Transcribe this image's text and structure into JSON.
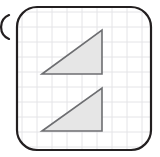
{
  "figure": {
    "title": "Two congruent right triangles on a square grid",
    "answer_choice_marker": "partial-circle-arc-clipped-left-edge",
    "background_color": "#ffffff",
    "card": {
      "name": "rounded-rectangle-panel",
      "x": 17,
      "y": 7,
      "width": 134,
      "height": 143,
      "corner_radius": 20,
      "stroke_color": "#231f20",
      "stroke_width": 2.2,
      "fill_color": "#ffffff"
    },
    "clipped_marker": {
      "name": "clipped-arc",
      "center_x": -4,
      "center_y": 27,
      "radius": 13,
      "stroke_color": "#231f20",
      "stroke_width": 2.2
    },
    "grid": {
      "name": "square-grid",
      "line_color": "#e4e4e7",
      "line_width": 1,
      "cell_size": 15,
      "origin_x": 22,
      "origin_y": 12,
      "columns": 8,
      "rows": 9,
      "visible": true
    },
    "shapes": [
      {
        "name": "triangle-upper",
        "type": "right-triangle",
        "right_angle_vertex": "bottom-right",
        "orientation": "hypotenuse-rises-left-to-right",
        "fill_color": "#e6e6e6",
        "stroke_color": "#6d6e71",
        "stroke_width": 1.6,
        "points": [
          {
            "x": 42,
            "y": 74
          },
          {
            "x": 102,
            "y": 30
          },
          {
            "x": 102,
            "y": 74
          }
        ],
        "base_length_px": 60,
        "height_px": 44
      },
      {
        "name": "triangle-lower",
        "type": "right-triangle",
        "right_angle_vertex": "bottom-right",
        "orientation": "hypotenuse-rises-left-to-right",
        "fill_color": "#e6e6e6",
        "stroke_color": "#6d6e71",
        "stroke_width": 1.6,
        "points": [
          {
            "x": 42,
            "y": 131
          },
          {
            "x": 102,
            "y": 88
          },
          {
            "x": 102,
            "y": 131
          }
        ],
        "base_length_px": 60,
        "height_px": 43
      }
    ]
  }
}
